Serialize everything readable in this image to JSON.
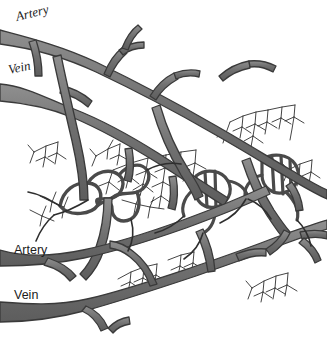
{
  "figure": {
    "width": 327,
    "height": 338,
    "background_color": "#ffffff"
  },
  "labels": [
    {
      "id": "artery-top",
      "text": "Artery",
      "style": "italic-serif",
      "x": 18,
      "y": 9,
      "rotation_deg": -14
    },
    {
      "id": "vein-top",
      "text": "Vein",
      "style": "italic-serif",
      "x": 10,
      "y": 62,
      "rotation_deg": -12
    },
    {
      "id": "artery-bottom",
      "text": "Artery",
      "style": "plain-sans",
      "x": 14,
      "y": 243,
      "rotation_deg": 0
    },
    {
      "id": "vein-bottom",
      "text": "Vein",
      "style": "plain-sans",
      "x": 14,
      "y": 288,
      "rotation_deg": 0
    }
  ],
  "colors": {
    "vessel_fill": "#6f6f6f",
    "vessel_fill_light": "#8c8c8c",
    "vessel_outline": "#3a3a3a",
    "capillary_stroke": "#252525",
    "background": "#ffffff"
  },
  "structures": {
    "major_vessels": [
      "artery-upper-left",
      "vein-upper-left",
      "artery-lower-left",
      "vein-lower-left"
    ],
    "capillary_bed_count": 5
  }
}
